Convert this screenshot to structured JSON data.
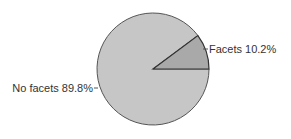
{
  "chart_data": {
    "type": "pie",
    "title": "",
    "slices": [
      {
        "label": "Facets",
        "value": 10.2,
        "display": "Facets 10.2%",
        "color": "#a9a9a9"
      },
      {
        "label": "No facets",
        "value": 89.8,
        "display": "No facets 89.8%",
        "color": "#c6c6c6"
      }
    ],
    "categories": [
      "Facets",
      "No facets"
    ],
    "values": [
      10.2,
      89.8
    ],
    "unit": "%",
    "legend": "none (labels attached to slices with leader lines)",
    "start_angle_deg": 0,
    "direction": "counterclockwise"
  },
  "labels": {
    "facets": "Facets 10.2%",
    "no_facets": "No facets 89.8%"
  },
  "colors": {
    "facets_slice": "#a9a9a9",
    "no_facets_slice": "#c6c6c6",
    "outline": "#555555",
    "background": "#ffffff"
  }
}
